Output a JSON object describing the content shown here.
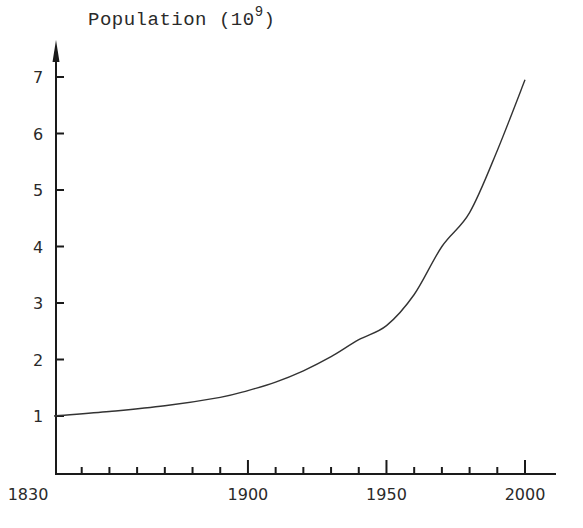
{
  "chart_data": {
    "type": "line",
    "title": "",
    "ylabel": "Population (10^9)",
    "ylabel_main": "Population (10",
    "ylabel_exp": "9",
    "ylabel_close": ")",
    "xlabel": "",
    "xlim": [
      1830,
      2000
    ],
    "ylim": [
      0,
      7
    ],
    "grid": false,
    "legend": null,
    "x_tick_labels": [
      "1830",
      "1900",
      "1950",
      "2000"
    ],
    "x_tick_label_values": [
      1830,
      1900,
      1950,
      2000
    ],
    "x_minor_tick_step": 10,
    "y_tick_labels": [
      "1",
      "2",
      "3",
      "4",
      "5",
      "6",
      "7"
    ],
    "series": [
      {
        "name": "World population",
        "x": [
          1830,
          1850,
          1870,
          1890,
          1900,
          1910,
          1920,
          1930,
          1940,
          1950,
          1960,
          1970,
          1980,
          1990,
          2000
        ],
        "values": [
          1.0,
          1.08,
          1.18,
          1.33,
          1.45,
          1.6,
          1.8,
          2.05,
          2.35,
          2.6,
          3.15,
          4.0,
          4.6,
          5.7,
          6.95
        ]
      }
    ]
  }
}
